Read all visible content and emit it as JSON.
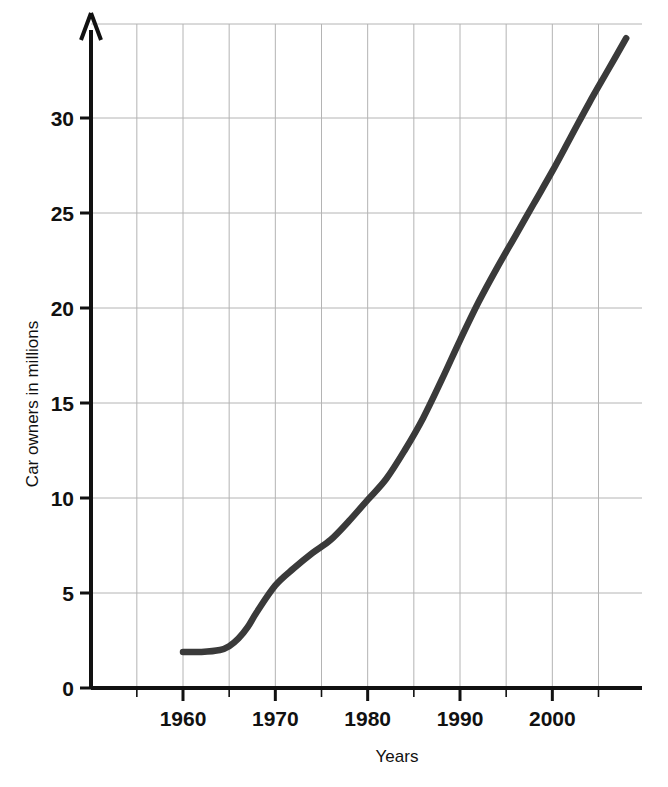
{
  "chart_data": {
    "type": "line",
    "title": "",
    "xlabel": "Years",
    "ylabel": "Car owners in millions",
    "xlim": [
      1950,
      2010
    ],
    "ylim": [
      0,
      34.5
    ],
    "grid": true,
    "legend": "none",
    "x_ticks_major": [
      1960,
      1970,
      1980,
      1990,
      2000
    ],
    "x_tick_labels": [
      "1960",
      "1970",
      "1980",
      "1990",
      "2000"
    ],
    "x_gridlines": [
      1955,
      1960,
      1965,
      1970,
      1975,
      1980,
      1985,
      1990,
      1995,
      2000,
      2005
    ],
    "y_ticks": [
      0,
      5,
      10,
      15,
      20,
      25,
      30
    ],
    "y_tick_labels": [
      "0",
      "5",
      "10",
      "15",
      "20",
      "25",
      "30"
    ],
    "y_gridlines": [
      5,
      10,
      15,
      20,
      25,
      30
    ],
    "series": [
      {
        "name": "Car owners",
        "color": "#3a3a3a",
        "x": [
          1960,
          1962,
          1964,
          1965,
          1966,
          1967,
          1968,
          1970,
          1972,
          1974,
          1976,
          1978,
          1980,
          1982,
          1984,
          1986,
          1988,
          1990,
          1992,
          1994,
          1996,
          1998,
          2000,
          2002,
          2004,
          2006,
          2008
        ],
        "values": [
          1.9,
          1.9,
          2.0,
          2.2,
          2.6,
          3.2,
          4.0,
          5.4,
          6.3,
          7.1,
          7.8,
          8.8,
          9.9,
          11.0,
          12.5,
          14.2,
          16.2,
          18.3,
          20.3,
          22.1,
          23.8,
          25.5,
          27.2,
          29.0,
          30.8,
          32.5,
          34.2
        ]
      }
    ],
    "axis_arrow_y": true,
    "axis_color": "#111111",
    "grid_color": "#b4b4b4"
  },
  "labels": {
    "x_axis_title": "Years",
    "y_axis_title": "Car owners in millions"
  }
}
